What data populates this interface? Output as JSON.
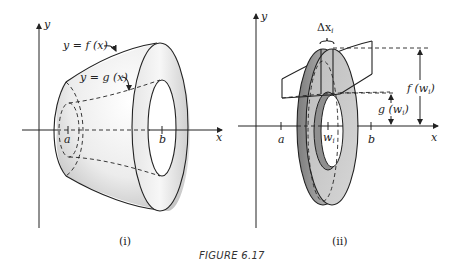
{
  "figure": {
    "caption": "FIGURE 6.17",
    "panels": [
      {
        "id": "i",
        "label": "(i)",
        "axes": {
          "x_label": "x",
          "y_label": "y"
        },
        "curve_labels": {
          "outer": "y = f (x)",
          "inner": "y = g (x)"
        },
        "ticks": {
          "a": "a",
          "b": "b"
        }
      },
      {
        "id": "ii",
        "label": "(ii)",
        "axes": {
          "x_label": "x",
          "y_label": "y"
        },
        "annotations": {
          "delta_x": "Δx",
          "delta_x_sub": "i",
          "outer_radius": "f (w",
          "outer_radius_sub": "i",
          "outer_radius_close": ")",
          "inner_radius": "g (w",
          "inner_radius_sub": "i",
          "inner_radius_close": ")"
        },
        "ticks": {
          "a": "a",
          "w": "w",
          "w_sub": "i",
          "b": "b"
        }
      }
    ],
    "colors": {
      "ink": "#222222",
      "shade_light": "#f2f2f2",
      "shade_mid": "#cfcfcf",
      "shade_dark": "#8a8a8a"
    }
  }
}
